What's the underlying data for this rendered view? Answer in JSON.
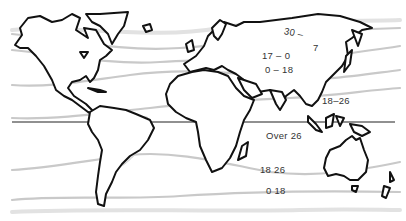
{
  "map": {
    "title": "",
    "subject": "World climate temperature zones",
    "zone_labels": [
      {
        "id": "arctic-band",
        "text": "30 –"
      },
      {
        "id": "arctic-band-mark",
        "text": "7"
      },
      {
        "id": "cold-band",
        "text": "17 – 0"
      },
      {
        "id": "temperate-north-band",
        "text": "0 – 18"
      },
      {
        "id": "subtropical-north-band",
        "text": "18–26"
      },
      {
        "id": "tropical-band",
        "text": "Over 26"
      },
      {
        "id": "subtropical-south-band",
        "text": "18   26"
      },
      {
        "id": "temperate-south-band",
        "text": "0  18"
      }
    ],
    "colors": {
      "coastline": "#111111",
      "isotherm": "#c9c9c9",
      "equator": "#222222",
      "background": "#ffffff"
    }
  }
}
